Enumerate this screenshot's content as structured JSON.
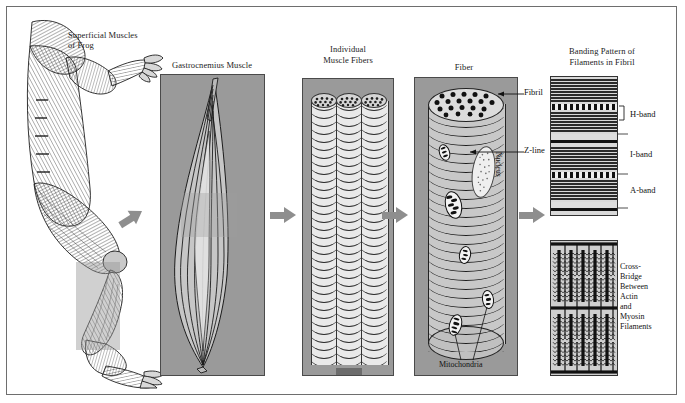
{
  "figure": {
    "background": "#ffffff",
    "panel_fill": "#9a9a9a",
    "arrow_color": "#8e8e8e"
  },
  "panels": [
    {
      "id": "frog",
      "caption": "Superficial Muscles\nof Frog",
      "caption_line1": "Superficial Muscles",
      "caption_line2": "of Frog",
      "content": "line-art lateral view of a frog showing superficial musculature with a highlight box over the calf"
    },
    {
      "id": "gastrocnemius",
      "caption": "Gastrocnemius Muscle",
      "content": "spindle-shaped whole muscle with longitudinal fascicle lines"
    },
    {
      "id": "fibers",
      "caption": "Individual\nMuscle Fibers",
      "caption_line1": "Individual",
      "caption_line2": "Muscle Fibers",
      "content": "three striated cylindrical muscle fibers side by side"
    },
    {
      "id": "fiber",
      "caption": "Fiber",
      "content": "single muscle fiber cylinder with fibrils in cross-section, nucleus and mitochondria"
    },
    {
      "id": "fibril",
      "caption": "Banding Pattern of\nFilaments in Fibril",
      "caption_line1": "Banding Pattern of",
      "caption_line2": "Filaments in Fibril",
      "content": "striated fibril banding pattern above, magnified actin/myosin filament lattice below"
    }
  ],
  "callouts": {
    "fibril": "Fibril",
    "z_line": "Z-line",
    "nucleus": "Nucleus",
    "mitochondria": "Mitochondria",
    "h_band": "H-band",
    "i_band": "I-band",
    "a_band": "A-band",
    "cross_bridge": "Cross-\nBridge\nBetween\nActin\nand\nMyosin\nFilaments"
  },
  "arrows": [
    {
      "id": "frog-to-muscle",
      "direction": "up-right"
    },
    {
      "id": "muscle-to-fibers",
      "direction": "right"
    },
    {
      "id": "fibers-to-fiber",
      "direction": "right"
    },
    {
      "id": "fiber-to-fibril",
      "direction": "right"
    }
  ]
}
